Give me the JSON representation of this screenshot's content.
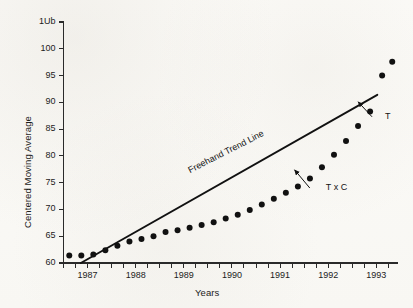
{
  "chart_data": {
    "type": "scatter",
    "title": "",
    "xlabel": "Years",
    "ylabel": "Centered Moving Average",
    "xlim": [
      1986.5,
      1993.45
    ],
    "ylim": [
      60,
      105
    ],
    "grid": false,
    "legend_position": "none",
    "y_ticks": [
      60,
      65,
      70,
      75,
      80,
      85,
      90,
      95,
      100,
      105
    ],
    "y_tick_labels": [
      "60",
      "65",
      "70",
      "75",
      "80",
      "85",
      "90",
      "95",
      "100",
      "1Ub"
    ],
    "y_top_label_note": "top tick label printed as '1Ub' in the scan (degraded '105')",
    "x_ticks": [
      1987,
      1988,
      1989,
      1990,
      1991,
      1992,
      1993
    ],
    "x_tick_labels": [
      "1987",
      "1988",
      "1989",
      "1990",
      "1991",
      "1992",
      "1993"
    ],
    "x_minor_ticks_per_year": 4,
    "series": [
      {
        "name": "T x C",
        "marker": "filled-circle",
        "color": "#111111",
        "x": [
          1986.62,
          1986.87,
          1987.12,
          1987.37,
          1987.62,
          1987.87,
          1988.12,
          1988.37,
          1988.62,
          1988.87,
          1989.12,
          1989.37,
          1989.62,
          1989.87,
          1990.12,
          1990.37,
          1990.62,
          1990.87,
          1991.12,
          1991.37,
          1991.62,
          1991.87,
          1992.12,
          1992.37,
          1992.62,
          1992.87,
          1993.12,
          1993.33
        ],
        "y": [
          61.4,
          61.4,
          61.6,
          62.4,
          63.2,
          64.0,
          64.5,
          65.0,
          65.8,
          66.1,
          66.6,
          67.1,
          67.6,
          68.3,
          69.0,
          69.9,
          70.9,
          72.0,
          73.1,
          74.3,
          75.8,
          77.9,
          80.2,
          82.8,
          85.6,
          88.3,
          95.0,
          97.6
        ],
        "y_note": "filled black circle markers, quarterly centered moving average values read off the 60-105 axis"
      },
      {
        "name": "Freehand Trend Line",
        "marker": "none",
        "line": "solid",
        "color": "#111111",
        "x": [
          1986.86,
          1993.02
        ],
        "y": [
          60.0,
          91.4
        ]
      }
    ],
    "annotations": [
      {
        "name": "trend-line-label",
        "text": "Freehand Trend Line",
        "x": 1989.15,
        "y": 78.3,
        "rotation_deg": -27
      },
      {
        "name": "txc-callout",
        "text": "T x C",
        "label_x": 1991.95,
        "label_y": 74.0,
        "arrow_to_x": 1991.3,
        "arrow_to_y": 77.4
      },
      {
        "name": "t-callout",
        "text": "T",
        "label_x": 1993.18,
        "label_y": 87.3,
        "arrow_to_x": 1992.62,
        "arrow_to_y": 90.1
      }
    ]
  },
  "colors": {
    "marker": "#111111",
    "line": "#111111",
    "axis": "#2a2a2a",
    "text": "#1c1c1c",
    "background": "#fbfaf7"
  }
}
